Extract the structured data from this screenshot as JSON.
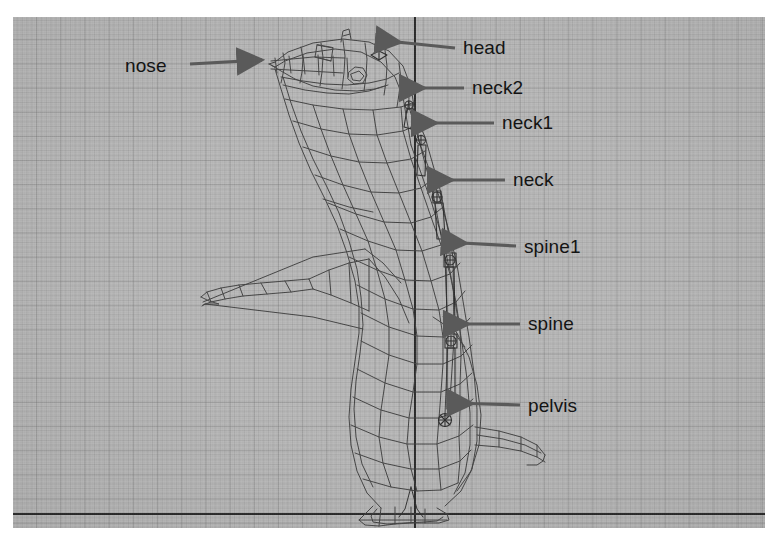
{
  "viewport": {
    "background_color": "#b9b9b9",
    "grid_minor_color": "#828282",
    "grid_major_color": "#787878",
    "axis_color": "#2b2b2b",
    "axis_vertical_x": 401,
    "axis_horizontal_y": 496,
    "width": 752,
    "height": 511
  },
  "model": {
    "name": "penguin-wireframe-mesh",
    "wire_color": "#3a3a3a",
    "armature_color": "#2f2f2f",
    "description": "penguin character wireframe with armature bone chain"
  },
  "annotations": {
    "arrow_color": "#5a5a5a",
    "text_color": "#141414",
    "items": [
      {
        "id": "nose",
        "label": "nose",
        "label_x": 125,
        "label_y": 56,
        "arrow_dir": "right",
        "arrow_x1": 190,
        "arrow_y1": 64,
        "arrow_x2": 268,
        "arrow_y2": 60
      },
      {
        "id": "head",
        "label": "head",
        "label_x": 463,
        "label_y": 38,
        "arrow_dir": "left",
        "arrow_x1": 455,
        "arrow_y1": 48,
        "arrow_x2": 372,
        "arrow_y2": 40
      },
      {
        "id": "neck2",
        "label": "neck2",
        "label_x": 472,
        "label_y": 78,
        "arrow_dir": "left",
        "arrow_x1": 464,
        "arrow_y1": 88,
        "arrow_x2": 396,
        "arrow_y2": 88
      },
      {
        "id": "neck1",
        "label": "neck1",
        "label_x": 502,
        "label_y": 113,
        "arrow_dir": "left",
        "arrow_x1": 494,
        "arrow_y1": 123,
        "arrow_x2": 408,
        "arrow_y2": 123
      },
      {
        "id": "neck",
        "label": "neck",
        "label_x": 513,
        "label_y": 170,
        "arrow_dir": "left",
        "arrow_x1": 505,
        "arrow_y1": 180,
        "arrow_x2": 424,
        "arrow_y2": 180
      },
      {
        "id": "spine1",
        "label": "spine1",
        "label_x": 524,
        "label_y": 237,
        "arrow_dir": "left",
        "arrow_x1": 516,
        "arrow_y1": 246,
        "arrow_x2": 437,
        "arrow_y2": 242
      },
      {
        "id": "spine",
        "label": "spine",
        "label_x": 528,
        "label_y": 314,
        "arrow_dir": "left",
        "arrow_x1": 520,
        "arrow_y1": 324,
        "arrow_x2": 440,
        "arrow_y2": 324
      },
      {
        "id": "pelvis",
        "label": "pelvis",
        "label_x": 528,
        "label_y": 396,
        "arrow_dir": "left",
        "arrow_x1": 520,
        "arrow_y1": 405,
        "arrow_x2": 444,
        "arrow_y2": 403
      }
    ]
  }
}
